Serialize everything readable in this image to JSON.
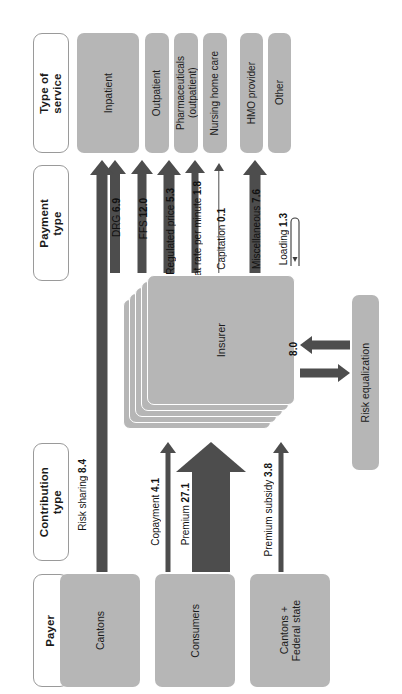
{
  "diagram": {
    "columns": [
      {
        "key": "service",
        "label": "Type of\nservice"
      },
      {
        "key": "payment",
        "label": "Payment\ntype"
      },
      {
        "key": "contribution",
        "label": "Contribution\ntype"
      },
      {
        "key": "payer",
        "label": "Payer"
      }
    ],
    "services": [
      {
        "label": "Inpatient"
      },
      {
        "label": "Outpatient"
      },
      {
        "label": "Pharmaceuticals\n(outpatient)"
      },
      {
        "label": "Nursing home care"
      },
      {
        "label": "HMO provider"
      },
      {
        "label": "Other"
      }
    ],
    "payment_flows": [
      {
        "label": "DRG",
        "value": "6.9"
      },
      {
        "label": "FFS",
        "value": "12.0"
      },
      {
        "label": "Regulated price",
        "value": "5.3"
      },
      {
        "label": "Flat rate per minute",
        "value": "1.8"
      },
      {
        "label": "Capitation",
        "value": "0.1"
      },
      {
        "label": "Miscellaneous",
        "value": "7.6"
      },
      {
        "label": "Loading",
        "value": "1.3"
      }
    ],
    "contribution_flows": [
      {
        "label": "Risk sharing",
        "value": "8.4"
      },
      {
        "label": "Copayment",
        "value": "4.1"
      },
      {
        "label": "Premium",
        "value": "27.1"
      },
      {
        "label": "Premium subsidy",
        "value": "3.8"
      }
    ],
    "payers": [
      {
        "label": "Cantons"
      },
      {
        "label": "Consumers"
      },
      {
        "label": "Cantons +\nFederal state"
      }
    ],
    "insurer": {
      "label": "Insurer"
    },
    "risk_equalization": {
      "label": "Risk equalization",
      "value": "8.0"
    },
    "colors": {
      "node_fill": "#b6b6b6",
      "arrow_fill": "#4d4d4d",
      "header_border": "#9a9a9a",
      "background": "#ffffff"
    }
  }
}
